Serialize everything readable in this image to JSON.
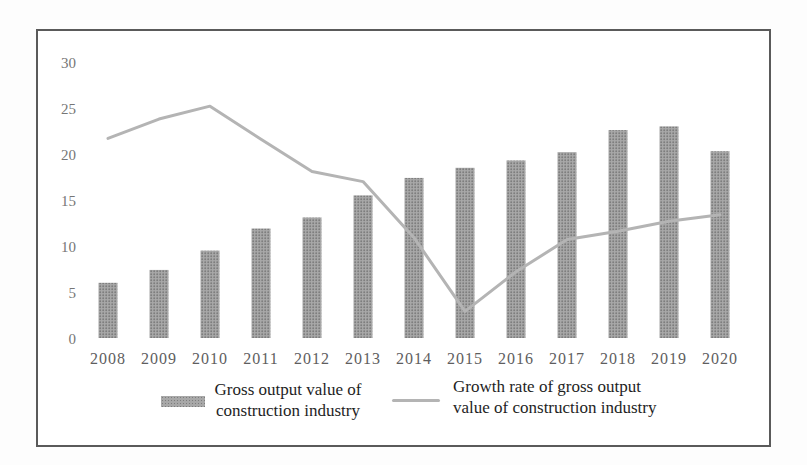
{
  "chart_data": {
    "type": "bar",
    "subtype": "bar+line combo",
    "title": "",
    "xlabel": "",
    "ylabel": "",
    "categories": [
      "2008",
      "2009",
      "2010",
      "2011",
      "2012",
      "2013",
      "2014",
      "2015",
      "2016",
      "2017",
      "2018",
      "2019",
      "2020"
    ],
    "series": [
      {
        "name": "Gross output value of construction industry",
        "type": "bar",
        "values": [
          6.0,
          7.4,
          9.5,
          11.9,
          13.1,
          15.5,
          17.4,
          18.5,
          19.3,
          20.2,
          22.6,
          23.0,
          20.3
        ]
      },
      {
        "name": "Growth rate of gross output value of construction industry",
        "type": "line",
        "values": [
          21.7,
          23.8,
          25.2,
          21.6,
          18.1,
          17.0,
          10.9,
          2.9,
          7.2,
          10.7,
          11.6,
          12.7,
          13.4
        ]
      }
    ],
    "ylim": [
      0,
      30
    ],
    "yticks": [
      0,
      5,
      10,
      15,
      20,
      25,
      30
    ],
    "grid": false,
    "legend_position": "bottom",
    "colors": {
      "bar": "#9b9b9b",
      "bar_dot": "#7d7d7d",
      "bar_base": "#a8a8a8",
      "line": "#b4b4b4",
      "ytick_label": "#767676",
      "xtick_label": "#5e5e5e",
      "legend_text": "#1e1e1e",
      "frame_border": "#5a5a5a"
    }
  },
  "legend": {
    "bar": {
      "lines": [
        "Gross output value of",
        "construction industry"
      ]
    },
    "line": {
      "lines": [
        "Growth rate of gross output",
        "value of construction industry"
      ]
    }
  }
}
